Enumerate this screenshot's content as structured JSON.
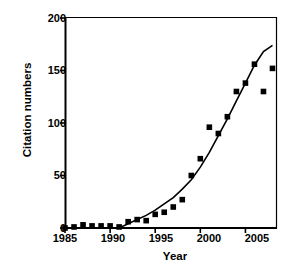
{
  "chart_data": {
    "type": "scatter",
    "title": "",
    "xlabel": "Year",
    "ylabel": "Citation numbers",
    "xlim": [
      1985,
      2008.5
    ],
    "ylim": [
      0,
      200
    ],
    "xticks": [
      "1985",
      "1990",
      "1995",
      "2000",
      "2005"
    ],
    "xtick_values": [
      1985,
      1990,
      1995,
      2000,
      2005
    ],
    "yticks": [
      "0",
      "50",
      "100",
      "150",
      "200"
    ],
    "ytick_values": [
      0,
      50,
      100,
      150,
      200
    ],
    "grid": false,
    "legend": "none",
    "marker": "filled-square",
    "marker_color": "#000000",
    "line_color": "#000000",
    "x": [
      1985,
      1986,
      1987,
      1988,
      1989,
      1990,
      1991,
      1992,
      1993,
      1994,
      1995,
      1996,
      1997,
      1998,
      1999,
      2000,
      2001,
      2002,
      2003,
      2004,
      2005,
      2006,
      2007,
      2008
    ],
    "values": [
      0,
      1,
      3,
      2,
      2,
      2,
      1,
      6,
      8,
      7,
      13,
      15,
      20,
      27,
      50,
      66,
      96,
      90,
      106,
      130,
      138,
      156,
      130,
      152
    ],
    "series": [
      {
        "name": "Citation numbers",
        "type": "scatter",
        "values": [
          0,
          1,
          3,
          2,
          2,
          2,
          1,
          6,
          8,
          7,
          13,
          15,
          20,
          27,
          50,
          66,
          96,
          90,
          106,
          130,
          138,
          156,
          130,
          152
        ]
      },
      {
        "name": "fitted trend curve",
        "type": "line",
        "x": [
          1991,
          1992,
          1993,
          1994,
          1995,
          1996,
          1997,
          1998,
          1999,
          2000,
          2001,
          2002,
          2003,
          2004,
          2005,
          2006,
          2007,
          2008
        ],
        "values": [
          0,
          4,
          8,
          12,
          17,
          23,
          29,
          37,
          46,
          58,
          72,
          88,
          104,
          121,
          138,
          155,
          168,
          174
        ]
      }
    ]
  }
}
